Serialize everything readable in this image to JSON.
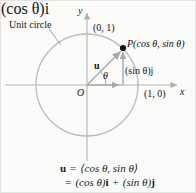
{
  "figure": {
    "type": "unit-circle-vector-diagram",
    "background_color": "#fbfbf9",
    "stroke_color": "#b9b9b9",
    "axis_color": "#b5b5b5",
    "point_color": "#111111",
    "text_color": "#141414"
  },
  "labels": {
    "unit_circle": "Unit circle",
    "y_axis": "y",
    "x_axis": "x",
    "origin": "O",
    "point_0_1": "(0, 1)",
    "point_1_0": "(1, 0)",
    "point_P": "P(cos θ, sin θ)",
    "vector_u": "u",
    "angle_theta": "θ",
    "component_i": "(cos θ)i",
    "component_j": "(sin θ)j"
  },
  "equation": {
    "line1_lhs": "u",
    "line1_eq": "=",
    "line1_rhs": "⟨cos θ, sin θ⟩",
    "line2_eq": "=",
    "line2_rhs_a": "(cos θ)",
    "line2_rhs_a_unit": "i",
    "line2_plus": "+",
    "line2_rhs_b": "(sin θ)",
    "line2_rhs_b_unit": "j"
  },
  "geometry": {
    "origin_x": 86,
    "origin_y": 84,
    "radius": 51,
    "point_P_x": 122,
    "point_P_y": 47,
    "theta_degrees": 44
  }
}
